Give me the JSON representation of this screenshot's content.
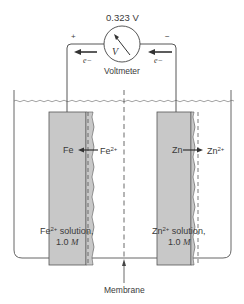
{
  "voltmeter": {
    "reading": "0.323 V",
    "label": "Voltmeter",
    "symbol": "V",
    "positive_terminal": "+",
    "negative_terminal": "−"
  },
  "electron_flow": {
    "left_label": "e−",
    "right_label": "e−",
    "direction": "right-to-left"
  },
  "left_half_cell": {
    "electrode": "Fe",
    "ion": "Fe",
    "ion_charge": "2+",
    "reaction_direction": "ion-to-metal",
    "solution_ion": "Fe",
    "solution_charge": "2+",
    "solution_text": " solution,",
    "concentration_value": "1.0",
    "concentration_unit": "M"
  },
  "right_half_cell": {
    "electrode": "Zn",
    "ion": "Zn",
    "ion_charge": "2+",
    "reaction_direction": "metal-to-ion",
    "solution_ion": "Zn",
    "solution_charge": "2+",
    "solution_text": " solution,",
    "concentration_value": "1.0",
    "concentration_unit": "M"
  },
  "membrane": {
    "label": "Membrane"
  },
  "colors": {
    "line": "#444444",
    "electrode_fill": "#c8c8c8",
    "background": "#ffffff"
  }
}
